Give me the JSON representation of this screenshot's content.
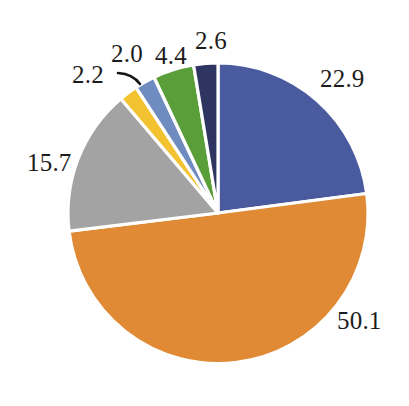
{
  "chart_data": {
    "type": "pie",
    "title": "",
    "subtitle": "",
    "xlabel": "",
    "ylabel": "",
    "legend": "none",
    "grid": false,
    "total": 99.9,
    "start_angle_deg": 0,
    "direction": "clockwise",
    "categories": [
      "22.9",
      "50.1",
      "15.7",
      "2.0",
      "2.2",
      "4.4",
      "2.6"
    ],
    "values": [
      22.9,
      50.1,
      15.7,
      2.0,
      2.2,
      4.4,
      2.6
    ],
    "colors": [
      "#4a5a9e",
      "#e08a35",
      "#a3a3a3",
      "#f2c230",
      "#6f8cc0",
      "#5a9e3a",
      "#2e3560"
    ],
    "slices": [
      {
        "label": "22.9",
        "value": 22.9,
        "color": "#4a5a9e",
        "label_x": 320,
        "label_y": 66,
        "order": 1
      },
      {
        "label": "50.1",
        "value": 50.1,
        "color": "#e08a35",
        "label_x": 337,
        "label_y": 308,
        "order": 2
      },
      {
        "label": "15.7",
        "value": 15.7,
        "color": "#a3a3a3",
        "label_x": 27,
        "label_y": 150,
        "order": 3
      },
      {
        "label": "2.0",
        "value": 2.0,
        "color": "#f2c230",
        "label_x": 111,
        "label_y": 41,
        "order": 4,
        "has_leader_line": true
      },
      {
        "label": "2.2",
        "value": 2.2,
        "color": "#6f8cc0",
        "label_x": 72,
        "label_y": 62,
        "order": 5
      },
      {
        "label": "4.4",
        "value": 4.4,
        "color": "#5a9e3a",
        "label_x": 155,
        "label_y": 43,
        "order": 6
      },
      {
        "label": "2.6",
        "value": 2.6,
        "color": "#2e3560",
        "label_x": 195,
        "label_y": 28,
        "order": 7
      }
    ],
    "geometry": {
      "center_x": 218,
      "center_y": 213,
      "radius": 150,
      "separator_color": "#ffffff"
    }
  },
  "background_color": "#ffffff",
  "label_color": "#1c1c1c"
}
